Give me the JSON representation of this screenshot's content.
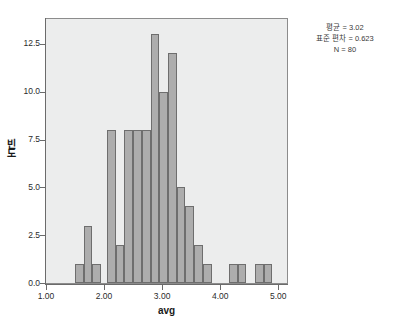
{
  "chart_data": {
    "type": "bar",
    "title": "",
    "xlabel": "avg",
    "ylabel": "빈도",
    "xlim": [
      1.0,
      5.15
    ],
    "ylim": [
      0,
      13.8
    ],
    "grid": false,
    "bin_width": 0.15,
    "x_ticks": [
      "1.00",
      "2.00",
      "3.00",
      "4.00",
      "5.00"
    ],
    "x_tick_values": [
      1.0,
      2.0,
      3.0,
      4.0,
      5.0
    ],
    "y_ticks": [
      "0.0",
      "2.5",
      "5.0",
      "7.5",
      "10.0",
      "12.5"
    ],
    "y_tick_values": [
      0.0,
      2.5,
      5.0,
      7.5,
      10.0,
      12.5
    ],
    "bin_starts": [
      1.5,
      1.65,
      1.8,
      2.05,
      2.2,
      2.35,
      2.5,
      2.65,
      2.8,
      2.95,
      3.1,
      3.25,
      3.4,
      3.55,
      3.7,
      4.15,
      4.3,
      4.6,
      4.75
    ],
    "categories": [
      "1.50-1.65",
      "1.65-1.80",
      "1.80-1.95",
      "2.05-2.20",
      "2.20-2.35",
      "2.35-2.50",
      "2.50-2.65",
      "2.65-2.80",
      "2.80-2.95",
      "2.95-3.10",
      "3.10-3.25",
      "3.25-3.40",
      "3.40-3.55",
      "3.55-3.70",
      "3.70-3.85",
      "4.15-4.30",
      "4.30-4.45",
      "4.60-4.75",
      "4.75-4.90"
    ],
    "values": [
      1,
      3,
      1,
      8,
      2,
      8,
      8,
      8,
      13,
      10,
      12,
      5,
      4,
      2,
      1,
      1,
      1,
      1,
      1
    ],
    "bar_color": "#adadad",
    "bar_edge_color": "#6e6e6e",
    "plot_background": "#eceded"
  },
  "stats": {
    "mean_label": "평균 = 3.02",
    "sd_label": "표준 편차 = 0.623",
    "n_label": "N = 80"
  },
  "axes": {
    "x_title": "avg",
    "y_title": "빈도"
  }
}
